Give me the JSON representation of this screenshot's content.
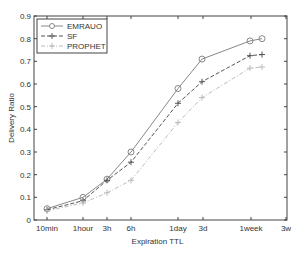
{
  "chart_data": {
    "type": "line",
    "title": "",
    "xlabel": "Expiration TTL",
    "ylabel": "Delivery Ratio",
    "ylim": [
      0,
      0.9
    ],
    "yticks": [
      "0",
      "0.1",
      "0.2",
      "0.3",
      "0.4",
      "0.5",
      "0.6",
      "0.7",
      "0.8",
      "0.9"
    ],
    "categories": [
      "10min",
      "1hour",
      "3h",
      "6h",
      "1day",
      "3d",
      "1week",
      "3w"
    ],
    "grid": false,
    "legend_position": "upper left",
    "point_x_px": [
      47,
      83,
      107,
      131,
      178,
      202,
      250,
      262
    ],
    "series": [
      {
        "name": "EMRAUO",
        "marker": "circle",
        "style": "solid",
        "color": "#888888",
        "values": [
          0.05,
          0.1,
          0.18,
          0.3,
          0.58,
          0.71,
          0.79,
          0.8
        ]
      },
      {
        "name": "SF",
        "marker": "plus",
        "style": "dashed",
        "color": "#555555",
        "values": [
          0.045,
          0.085,
          0.175,
          0.255,
          0.515,
          0.61,
          0.725,
          0.73
        ]
      },
      {
        "name": "PROPHET",
        "marker": "plus",
        "style": "dashdot",
        "color": "#bbbbbb",
        "values": [
          0.04,
          0.075,
          0.12,
          0.175,
          0.43,
          0.54,
          0.67,
          0.675
        ]
      }
    ]
  }
}
